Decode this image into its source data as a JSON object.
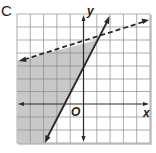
{
  "panel": {
    "label": "C"
  },
  "axes": {
    "x_label": "x",
    "y_label": "y",
    "origin_label": "O"
  },
  "graph": {
    "grid_columns": 10,
    "grid_rows": 10,
    "solid_line": {
      "style": "solid",
      "equation_hint": "y = 2x + 3"
    },
    "dashed_line": {
      "style": "dashed",
      "equation_hint": "y ≈ x/3 + 4.7"
    },
    "shaded_region": "left of solid line and below dashed line",
    "colors": {
      "shade": "#c8c8c8",
      "line": "#2a2a2a",
      "grid": "#8a8a8a",
      "frame_shadow": "#bdbdbd"
    }
  }
}
